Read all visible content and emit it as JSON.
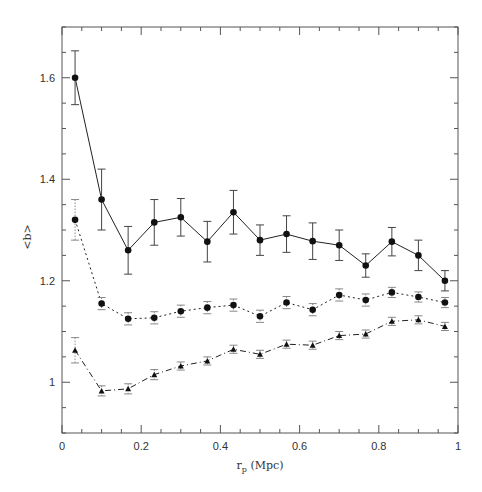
{
  "chart_data": {
    "type": "line",
    "title": "",
    "xlabel": "r_p (Mpc)",
    "xlabel_main": "r",
    "xlabel_sub": "p",
    "xlabel_rest": " (Mpc)",
    "ylabel": "<b>",
    "xlim": [
      0,
      1
    ],
    "ylim": [
      0.9,
      1.7
    ],
    "xticks": [
      0,
      0.2,
      0.4,
      0.6,
      0.8,
      1
    ],
    "xtick_labels": [
      "0",
      "0.2",
      "0.4",
      "0.6",
      "0.8",
      "1"
    ],
    "yticks": [
      1.0,
      1.2,
      1.4,
      1.6
    ],
    "ytick_labels": [
      "1",
      "1.2",
      "1.4",
      "1.6"
    ],
    "x_minor_step": 0.05,
    "y_minor_step": 0.05,
    "grid": false,
    "legend": null,
    "x": [
      0.033,
      0.1,
      0.167,
      0.233,
      0.3,
      0.367,
      0.433,
      0.5,
      0.567,
      0.633,
      0.7,
      0.767,
      0.833,
      0.9,
      0.967
    ],
    "series": [
      {
        "name": "upper",
        "line_style": "solid",
        "marker": "circle",
        "values": [
          1.6,
          1.36,
          1.26,
          1.315,
          1.325,
          1.277,
          1.335,
          1.28,
          1.292,
          1.278,
          1.27,
          1.23,
          1.277,
          1.25,
          1.2
        ],
        "errors": [
          0.053,
          0.06,
          0.047,
          0.045,
          0.037,
          0.04,
          0.043,
          0.03,
          0.036,
          0.036,
          0.03,
          0.023,
          0.028,
          0.03,
          0.02
        ]
      },
      {
        "name": "middle",
        "line_style": "dotted",
        "marker": "circle",
        "values": [
          1.32,
          1.155,
          1.125,
          1.127,
          1.14,
          1.147,
          1.152,
          1.13,
          1.157,
          1.143,
          1.172,
          1.162,
          1.177,
          1.168,
          1.157
        ],
        "errors": [
          0.04,
          0.012,
          0.012,
          0.012,
          0.012,
          0.012,
          0.012,
          0.012,
          0.012,
          0.012,
          0.012,
          0.012,
          0.01,
          0.01,
          0.01
        ]
      },
      {
        "name": "lower",
        "line_style": "dashdot",
        "marker": "triangle",
        "values": [
          1.063,
          0.983,
          0.987,
          1.015,
          1.032,
          1.042,
          1.065,
          1.055,
          1.075,
          1.073,
          1.092,
          1.095,
          1.12,
          1.123,
          1.11
        ],
        "errors": [
          0.025,
          0.01,
          0.01,
          0.01,
          0.008,
          0.008,
          0.008,
          0.008,
          0.008,
          0.008,
          0.008,
          0.008,
          0.008,
          0.008,
          0.008
        ]
      }
    ]
  }
}
